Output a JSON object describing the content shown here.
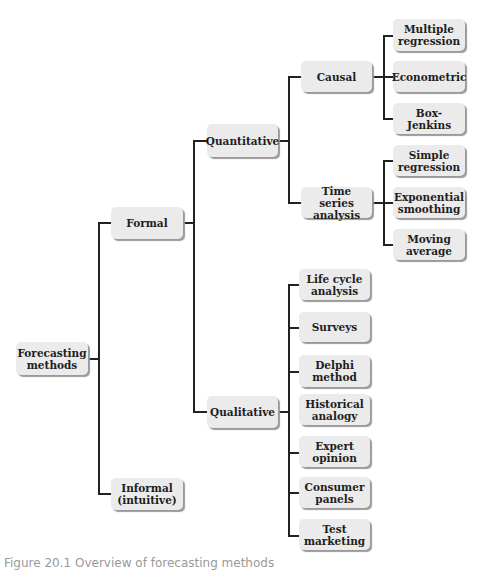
{
  "diagram": {
    "root": {
      "label": "Forecasting methods"
    },
    "level1": [
      {
        "label": "Formal"
      },
      {
        "label": "Informal (intuitive)"
      }
    ],
    "level2": [
      {
        "label": "Quantitative"
      },
      {
        "label": "Qualitative"
      }
    ],
    "quantitative_children": [
      {
        "label": "Causal"
      },
      {
        "label": "Time series analysis"
      }
    ],
    "causal_children": [
      {
        "label": "Multiple regression"
      },
      {
        "label": "Econometric"
      },
      {
        "label": "Box-Jenkins"
      }
    ],
    "time_series_children": [
      {
        "label": "Simple regression"
      },
      {
        "label": "Exponential smoothing"
      },
      {
        "label": "Moving average"
      }
    ],
    "qualitative_children": [
      {
        "label": "Life cycle analysis"
      },
      {
        "label": "Surveys"
      },
      {
        "label": "Delphi method"
      },
      {
        "label": "Historical analogy"
      },
      {
        "label": "Expert opinion"
      },
      {
        "label": "Consumer panels"
      },
      {
        "label": "Test marketing"
      }
    ]
  },
  "caption": "Figure 20.1   Overview of forecasting methods"
}
